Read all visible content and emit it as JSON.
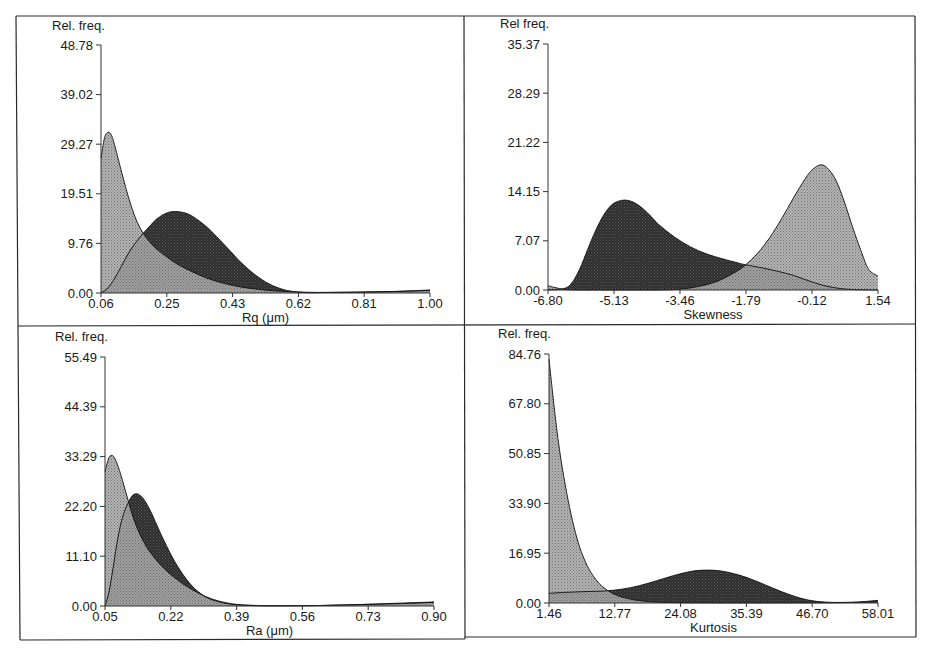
{
  "figure": {
    "border_color": "#2a2a2a",
    "light_fill": "#9a9a9a",
    "dark_fill": "#3a3a3a"
  },
  "chart_data": [
    {
      "id": "rq",
      "type": "area",
      "title": "",
      "ylabel": "Rel. freq.",
      "xlabel": "Rq (μm)",
      "x_ticks": [
        "0.06",
        "0.25",
        "0.43",
        "0.62",
        "0.81",
        "1.00"
      ],
      "y_ticks": [
        "0.00",
        "9.76",
        "19.51",
        "29.27",
        "39.02",
        "48.78"
      ],
      "xlim": [
        0.06,
        1.0
      ],
      "ylim": [
        0,
        48.78
      ],
      "grid": false,
      "legend": null,
      "layout": {
        "x0": 101,
        "x1": 430,
        "y0": 293,
        "y1": 45,
        "label_x": 52,
        "label_y": 30
      },
      "series": [
        {
          "name": "light distribution",
          "shade": "light",
          "x": [
            0.06,
            0.07,
            0.08,
            0.09,
            0.1,
            0.12,
            0.14,
            0.16,
            0.18,
            0.2,
            0.22,
            0.25,
            0.28,
            0.32,
            0.36,
            0.4,
            0.45,
            0.5,
            0.55,
            0.6,
            0.65,
            0.7,
            0.8,
            0.9,
            1.0
          ],
          "values": [
            26.5,
            30.5,
            31.6,
            31.0,
            28.8,
            23.5,
            18.5,
            14.5,
            11.8,
            10.0,
            8.6,
            7.0,
            5.6,
            4.2,
            3.0,
            2.1,
            1.3,
            0.8,
            0.45,
            0.25,
            0.15,
            0.12,
            0.15,
            0.3,
            0.6
          ]
        },
        {
          "name": "dark distribution",
          "shade": "dark",
          "x": [
            0.06,
            0.08,
            0.1,
            0.12,
            0.14,
            0.16,
            0.18,
            0.2,
            0.22,
            0.25,
            0.28,
            0.31,
            0.34,
            0.37,
            0.4,
            0.43,
            0.46,
            0.5,
            0.54,
            0.58,
            0.62,
            0.66,
            0.7,
            0.8,
            0.9,
            1.0
          ],
          "values": [
            0.0,
            1.0,
            3.0,
            5.5,
            8.0,
            10.0,
            11.7,
            13.2,
            14.6,
            15.8,
            16.0,
            15.5,
            14.2,
            12.5,
            10.4,
            8.2,
            6.0,
            3.6,
            1.8,
            0.7,
            0.2,
            0.05,
            0.1,
            0.2,
            0.3,
            0.5
          ]
        }
      ]
    },
    {
      "id": "skewness",
      "type": "area",
      "title": "",
      "ylabel": "Rel freq.",
      "xlabel": "Skewness",
      "x_ticks": [
        "-6.80",
        "-5.13",
        "-3.46",
        "-1.79",
        "-0.12",
        "1.54"
      ],
      "y_ticks": [
        "0.00",
        "7.07",
        "14.15",
        "21.22",
        "28.29",
        "35.37"
      ],
      "xlim": [
        -6.8,
        1.54
      ],
      "ylim": [
        0,
        35.37
      ],
      "grid": false,
      "legend": null,
      "layout": {
        "x0": 548,
        "x1": 878,
        "y0": 290,
        "y1": 44,
        "label_x": 500,
        "label_y": 28
      },
      "series": [
        {
          "name": "light distribution",
          "shade": "light",
          "x": [
            -6.8,
            -6.4,
            -6.0,
            -5.5,
            -5.0,
            -4.5,
            -4.0,
            -3.5,
            -3.0,
            -2.5,
            -2.0,
            -1.79,
            -1.5,
            -1.2,
            -0.9,
            -0.6,
            -0.3,
            -0.12,
            0.1,
            0.3,
            0.5,
            0.7,
            0.9,
            1.1,
            1.3,
            1.54
          ],
          "values": [
            0.6,
            0.1,
            0.0,
            0.0,
            0.0,
            0.0,
            0.0,
            0.1,
            0.5,
            1.3,
            2.8,
            3.7,
            5.3,
            7.5,
            10.2,
            13.2,
            16.0,
            17.3,
            18.0,
            17.3,
            15.5,
            12.5,
            9.0,
            5.8,
            3.0,
            2.0
          ]
        },
        {
          "name": "dark distribution",
          "shade": "dark",
          "x": [
            -6.8,
            -6.4,
            -6.2,
            -6.0,
            -5.8,
            -5.6,
            -5.4,
            -5.2,
            -5.0,
            -4.8,
            -4.6,
            -4.4,
            -4.2,
            -4.0,
            -3.6,
            -3.2,
            -2.8,
            -2.4,
            -2.0,
            -1.79,
            -1.4,
            -1.0,
            -0.6,
            -0.2,
            0.2,
            0.6,
            1.0,
            1.54
          ],
          "values": [
            0.0,
            0.2,
            1.0,
            3.0,
            5.8,
            8.5,
            10.7,
            12.2,
            12.8,
            12.9,
            12.5,
            11.7,
            10.6,
            9.4,
            7.6,
            6.2,
            5.2,
            4.5,
            3.9,
            3.6,
            3.2,
            2.7,
            2.1,
            1.3,
            0.6,
            0.2,
            0.05,
            0.0
          ]
        }
      ]
    },
    {
      "id": "ra",
      "type": "area",
      "title": "",
      "ylabel": "Rel. freq.",
      "xlabel": "Ra (μm)",
      "x_ticks": [
        "0.05",
        "0.22",
        "0.39",
        "0.56",
        "0.73",
        "0.90"
      ],
      "y_ticks": [
        "0.00",
        "11.10",
        "22.20",
        "33.29",
        "44.39",
        "55.49"
      ],
      "xlim": [
        0.05,
        0.9
      ],
      "ylim": [
        0,
        55.49
      ],
      "grid": false,
      "legend": null,
      "layout": {
        "x0": 105,
        "x1": 434,
        "y0": 606,
        "y1": 357,
        "label_x": 55,
        "label_y": 341
      },
      "series": [
        {
          "name": "light distribution",
          "shade": "light",
          "x": [
            0.05,
            0.06,
            0.07,
            0.08,
            0.09,
            0.1,
            0.11,
            0.12,
            0.13,
            0.14,
            0.15,
            0.16,
            0.18,
            0.2,
            0.22,
            0.25,
            0.28,
            0.31,
            0.34,
            0.37,
            0.4,
            0.45,
            0.5,
            0.6,
            0.7,
            0.8,
            0.9
          ],
          "values": [
            30.0,
            33.0,
            33.5,
            32.0,
            29.5,
            26.5,
            23.5,
            20.5,
            18.0,
            16.0,
            14.3,
            12.8,
            10.5,
            8.6,
            7.0,
            5.0,
            3.4,
            2.1,
            1.2,
            0.6,
            0.3,
            0.1,
            0.05,
            0.1,
            0.3,
            0.6,
            0.9
          ]
        },
        {
          "name": "dark distribution",
          "shade": "dark",
          "x": [
            0.05,
            0.06,
            0.07,
            0.08,
            0.09,
            0.1,
            0.11,
            0.12,
            0.13,
            0.14,
            0.15,
            0.16,
            0.17,
            0.18,
            0.2,
            0.22,
            0.24,
            0.26,
            0.28,
            0.3,
            0.32,
            0.35,
            0.38,
            0.41,
            0.45,
            0.5,
            0.6,
            0.7,
            0.8,
            0.9
          ],
          "values": [
            0.0,
            3.0,
            8.0,
            13.5,
            18.0,
            21.0,
            23.0,
            24.5,
            25.0,
            24.7,
            23.8,
            22.4,
            20.7,
            18.8,
            15.0,
            11.5,
            8.5,
            6.0,
            4.0,
            2.6,
            1.6,
            0.8,
            0.35,
            0.15,
            0.05,
            0.05,
            0.1,
            0.3,
            0.5,
            0.8
          ]
        }
      ]
    },
    {
      "id": "kurtosis",
      "type": "area",
      "title": "",
      "ylabel": "Rel. freq.",
      "xlabel": "Kurtosis",
      "x_ticks": [
        "1.46",
        "12.77",
        "24.08",
        "35.39",
        "46.70",
        "58.01"
      ],
      "y_ticks": [
        "0.00",
        "16.95",
        "33.90",
        "50.85",
        "67.80",
        "84.76"
      ],
      "xlim": [
        1.46,
        58.01
      ],
      "ylim": [
        0,
        84.76
      ],
      "grid": false,
      "legend": null,
      "layout": {
        "x0": 549,
        "x1": 878,
        "y0": 603,
        "y1": 354,
        "label_x": 498,
        "label_y": 338
      },
      "series": [
        {
          "name": "light distribution",
          "shade": "light",
          "x": [
            1.46,
            2.0,
            2.5,
            3.0,
            3.5,
            4.0,
            4.5,
            5.0,
            5.5,
            6.0,
            6.5,
            7.0,
            8.0,
            9.0,
            10.0,
            11.0,
            12.0,
            13.0,
            14.0,
            16.0,
            18.0,
            20.0,
            24.0,
            30.0,
            40.0,
            50.0,
            58.01
          ],
          "values": [
            83.0,
            73.0,
            64.0,
            56.0,
            49.0,
            43.0,
            37.5,
            32.5,
            28.0,
            24.0,
            20.5,
            17.5,
            12.8,
            9.4,
            6.8,
            5.0,
            3.7,
            2.7,
            2.0,
            1.1,
            0.6,
            0.3,
            0.1,
            0.05,
            0.05,
            0.1,
            0.3
          ]
        },
        {
          "name": "dark distribution",
          "shade": "dark",
          "x": [
            1.46,
            4.0,
            8.0,
            11.0,
            14.0,
            17.0,
            20.0,
            23.0,
            26.0,
            28.5,
            31.0,
            34.0,
            37.0,
            40.0,
            43.0,
            46.0,
            49.0,
            52.0,
            55.0,
            58.01
          ],
          "values": [
            3.3,
            3.6,
            3.9,
            4.1,
            4.7,
            5.9,
            7.6,
            9.4,
            10.8,
            11.2,
            10.9,
            9.6,
            7.5,
            5.0,
            2.7,
            1.0,
            0.3,
            0.2,
            0.4,
            0.9
          ]
        }
      ]
    }
  ]
}
